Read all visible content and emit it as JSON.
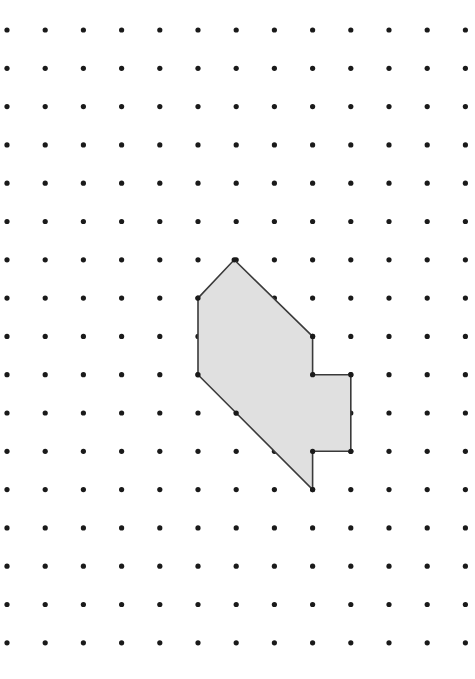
{
  "page": {
    "width": 475,
    "height": 679,
    "background_color": "#ffffff",
    "clipped_header_text": "Translation of"
  },
  "grid": {
    "name": "dot-grid",
    "origin_x": 7,
    "origin_y": 30,
    "spacing_x": 38.2,
    "spacing_y": 38.3,
    "columns": 13,
    "rows": 17,
    "dot_radius": 2.6,
    "dot_color": "#1a1a1a"
  },
  "figure": {
    "name": "shaded-polygon",
    "fill_color": "#e0e0e0",
    "stroke_color": "#3a3a3a",
    "stroke_width": 1.6,
    "vertex_marker_radius": 2.6,
    "vertex_marker_color": "#1a1a1a",
    "vertex_count": 10,
    "grid_vertices": [
      [
        6,
        6
      ],
      [
        8,
        8
      ],
      [
        8,
        9
      ],
      [
        9,
        9
      ],
      [
        9,
        11
      ],
      [
        8,
        11
      ],
      [
        8,
        12
      ],
      [
        6,
        10
      ],
      [
        5,
        9
      ],
      [
        5,
        7
      ]
    ],
    "pixel_vertices": [
      [
        234.2,
        259.8
      ],
      [
        312.6,
        336.4
      ],
      [
        312.6,
        374.7
      ],
      [
        350.8,
        374.7
      ],
      [
        350.8,
        451.3
      ],
      [
        312.6,
        451.3
      ],
      [
        312.6,
        489.6
      ],
      [
        236.2,
        413.0
      ],
      [
        198.0,
        374.7
      ],
      [
        198.0,
        298.1
      ]
    ]
  }
}
